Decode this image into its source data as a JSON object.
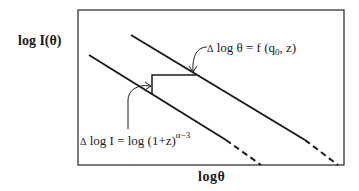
{
  "diagram": {
    "y_axis_label": "log  I(θ)",
    "x_axis_label": "logθ",
    "annotation_shift": {
      "delta": "Δ",
      "text": " log θ = f (q",
      "sub": "0",
      "tail": ", z)"
    },
    "annotation_dimming": {
      "delta": "Δ",
      "text": " log I = log (1+z)",
      "sup": "α−3"
    },
    "lines": [
      {
        "name": "lower-line",
        "solid_from": [
          89,
          55
        ],
        "solid_to": [
          226,
          140
        ],
        "dashed_to": [
          261,
          165
        ]
      },
      {
        "name": "upper-line",
        "solid_from": [
          131,
          35
        ],
        "solid_to": [
          305,
          140
        ],
        "dashed_to": [
          338,
          165
        ]
      }
    ],
    "colors": {
      "stroke": "#1a1a1a",
      "frame": "#333333",
      "background": "#ffffff"
    }
  }
}
